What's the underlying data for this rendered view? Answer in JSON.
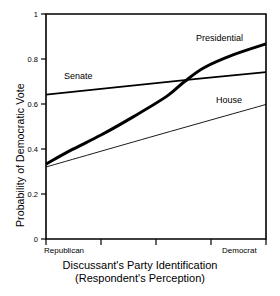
{
  "chart_data": {
    "type": "line",
    "title": "",
    "xlabel": "Discussant's Party Identification (Respondent's Perception)",
    "xlabel_line1": "Discussant's Party Identification",
    "xlabel_line2": "(Respondent's Perception)",
    "ylabel": "Probability of Democratic Vote",
    "xlim": [
      0,
      1
    ],
    "ylim": [
      0,
      1
    ],
    "grid": false,
    "legend_position": "inline-labels",
    "x_tick_labels": [
      "",
      "",
      "",
      "",
      ""
    ],
    "x_tick_values": [
      0,
      0.25,
      0.5,
      0.75,
      1
    ],
    "x_category_left": "Republican",
    "x_category_right": "Democrat",
    "y_tick_labels": [
      "0",
      "0.2",
      "0.4",
      "0.6",
      "0.8",
      "1"
    ],
    "y_tick_values": [
      0,
      0.2,
      0.4,
      0.6,
      0.8,
      1
    ],
    "series": [
      {
        "name": "Presidential",
        "style": "thick",
        "line_width": 3.0,
        "color": "#000000",
        "x": [
          0,
          0.12,
          0.25,
          0.4,
          0.55,
          0.63,
          0.72,
          0.85,
          1
        ],
        "values": [
          0.333,
          0.398,
          0.462,
          0.545,
          0.635,
          0.7,
          0.762,
          0.818,
          0.867
        ]
      },
      {
        "name": "Senate",
        "style": "medium",
        "line_width": 1.7,
        "color": "#000000",
        "x": [
          0,
          0.5,
          1
        ],
        "values": [
          0.642,
          0.693,
          0.742
        ]
      },
      {
        "name": "House",
        "style": "thin",
        "line_width": 0.9,
        "color": "#000000",
        "x": [
          0,
          0.5,
          1
        ],
        "values": [
          0.32,
          0.46,
          0.598
        ]
      }
    ]
  },
  "labels": {
    "presidential": "Presidential",
    "senate": "Senate",
    "house": "House"
  },
  "axes": {
    "y_title": "Probability of Democratic Vote",
    "x_title_line1": "Discussant's Party Identification",
    "x_title_line2": "(Respondent's Perception)",
    "x_left_category": "Republican",
    "x_right_category": "Democrat",
    "y0": "0",
    "y1": "0.2",
    "y2": "0.4",
    "y3": "0.6",
    "y4": "0.8",
    "y5": "1"
  },
  "colors": {
    "axis": "#000000",
    "line": "#000000",
    "background": "#ffffff"
  }
}
